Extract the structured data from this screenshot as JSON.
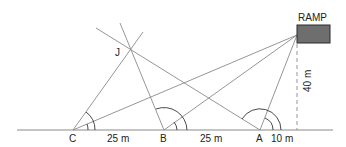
{
  "diagram": {
    "title": "",
    "ramp_label": "RAMP",
    "points": {
      "C": "C",
      "B": "B",
      "A": "A",
      "J": "J"
    },
    "distances": {
      "C_to_B": "25 m",
      "B_to_A": "25 m",
      "A_to_foot": "10 m",
      "height": "40 m"
    },
    "colors": {
      "line": "#8a8a8a",
      "ramp_fill": "#6e6e6e",
      "ramp_border": "#2a2a2a",
      "text": "#222222"
    }
  }
}
